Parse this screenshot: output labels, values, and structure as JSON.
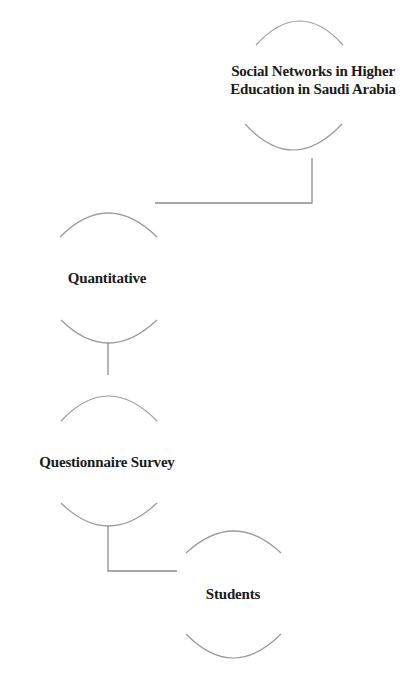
{
  "diagram": {
    "nodes": [
      {
        "id": "root",
        "lines": [
          "Social Networks in Higher",
          "Education in Saudi Arabia"
        ],
        "center": [
          297,
          86
        ]
      },
      {
        "id": "approach",
        "lines": [
          "Quantitative"
        ],
        "center": [
          108,
          278
        ]
      },
      {
        "id": "method",
        "lines": [
          "Questionnaire Survey"
        ],
        "center": [
          108,
          461
        ]
      },
      {
        "id": "participants",
        "lines": [
          "Students"
        ],
        "center": [
          233,
          594
        ]
      }
    ],
    "edges": [
      {
        "from": "root",
        "to": "approach"
      },
      {
        "from": "approach",
        "to": "method"
      },
      {
        "from": "method",
        "to": "participants"
      }
    ],
    "colors": {
      "text": "#1a1a1a",
      "arc": "#9a9a9a",
      "connector": "#8c8c8c",
      "background": "#ffffff"
    }
  }
}
